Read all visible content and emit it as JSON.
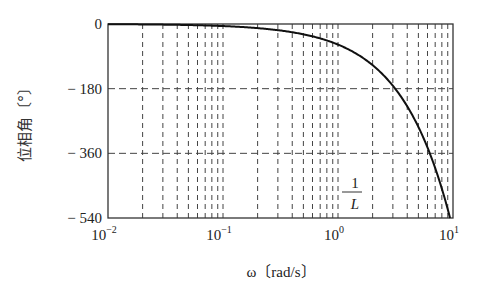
{
  "chart_data": {
    "type": "line",
    "title": "",
    "xlabel": "ω〔rad/s〕",
    "ylabel": "位相角〔°〕",
    "xscale": "log",
    "xlim": [
      0.01,
      10
    ],
    "ylim": [
      -540,
      0
    ],
    "xticks": [
      0.01,
      0.1,
      1,
      10
    ],
    "xtick_labels": [
      {
        "base": "10",
        "exp": "−2"
      },
      {
        "base": "10",
        "exp": "−1"
      },
      {
        "base": "10",
        "exp": "0"
      },
      {
        "base": "10",
        "exp": "1"
      }
    ],
    "yticks": [
      0,
      -180,
      -360,
      -540
    ],
    "ytick_labels": [
      "0",
      "− 180",
      "− 360",
      "− 540"
    ],
    "grid": true,
    "annotation": {
      "text_numerator": "1",
      "text_denominator": "L",
      "x": 1.0,
      "y": -480
    },
    "series": [
      {
        "name": "phase",
        "description": "phase of dead-time element e^(-jωL), L = 1 s",
        "x": [
          0.01,
          0.1,
          0.3,
          0.5,
          1,
          2,
          3,
          3.14,
          4,
          5,
          6,
          6.28,
          7,
          8,
          9,
          9.42
        ],
        "values": [
          -0.57,
          -5.7,
          -17.2,
          -28.6,
          -57.3,
          -114.6,
          -171.9,
          -180,
          -229.2,
          -286.5,
          -343.8,
          -360,
          -401.1,
          -458.4,
          -515.7,
          -540
        ]
      }
    ],
    "colors": {
      "line": "#111111",
      "grid": "#444444",
      "frame": "#333333"
    }
  }
}
